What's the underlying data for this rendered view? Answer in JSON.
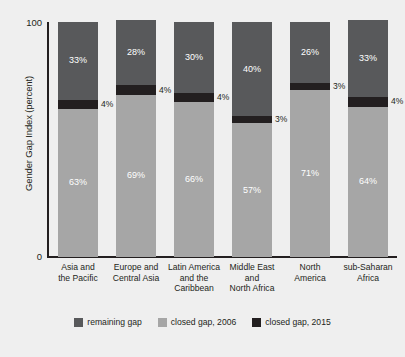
{
  "chart_data": {
    "type": "bar",
    "stacked": true,
    "title": "",
    "xlabel": "",
    "ylabel": "Gender Gap Index (percent)",
    "ylim": [
      0,
      100
    ],
    "ytick_labels": [
      "100",
      "0"
    ],
    "grid": false,
    "legend_position": "bottom",
    "categories": [
      "Asia and the Pacific",
      "Europe and Central Asia",
      "Latin America and the Caribbean",
      "Middle East and North Africa",
      "North America",
      "sub-Saharan Africa"
    ],
    "category_lines": [
      [
        "Asia and",
        "the Pacific"
      ],
      [
        "Europe and",
        "Central Asia"
      ],
      [
        "Latin America",
        "and the",
        "Caribbean"
      ],
      [
        "Middle East",
        "and",
        "North Africa"
      ],
      [
        "North",
        "America"
      ],
      [
        "sub-Saharan",
        "Africa"
      ]
    ],
    "series": [
      {
        "name": "closed gap, 2006",
        "color": "#a6a6a6",
        "values": [
          63,
          69,
          66,
          57,
          71,
          64
        ],
        "labels": [
          "63%",
          "69%",
          "66%",
          "57%",
          "71%",
          "64%"
        ],
        "label_placement": "inside"
      },
      {
        "name": "closed gap, 2015",
        "color": "#231f20",
        "values": [
          4,
          4,
          4,
          3,
          3,
          4
        ],
        "labels": [
          "4%",
          "4%",
          "4%",
          "3%",
          "3%",
          "4%"
        ],
        "label_placement": "outside"
      },
      {
        "name": "remaining gap",
        "color": "#58595b",
        "values": [
          33,
          28,
          30,
          40,
          26,
          33
        ],
        "labels": [
          "33%",
          "28%",
          "30%",
          "40%",
          "26%",
          "33%"
        ],
        "label_placement": "inside"
      }
    ]
  },
  "legend": {
    "items": [
      {
        "label": "remaining gap",
        "color": "#58595b"
      },
      {
        "label": "closed gap, 2006",
        "color": "#a6a6a6"
      },
      {
        "label": "closed gap, 2015",
        "color": "#231f20"
      }
    ]
  },
  "colors": {
    "background": "#efefef",
    "axis": "#231f20",
    "text": "#231f20",
    "label_on_bar": "#ffffff"
  }
}
